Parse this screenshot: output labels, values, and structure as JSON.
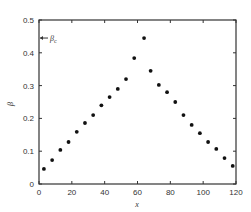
{
  "chart_data": {
    "type": "scatter",
    "title": "",
    "xlabel": "x",
    "ylabel": "β",
    "xlim": [
      0,
      120
    ],
    "ylim": [
      0,
      0.5
    ],
    "grid": false,
    "legend": null,
    "x_ticks": [
      0,
      20,
      40,
      60,
      80,
      100,
      120
    ],
    "x_tick_labels": [
      "0",
      "20",
      "40",
      "60",
      "80",
      "100",
      "120"
    ],
    "y_ticks": [
      0,
      0.1,
      0.2,
      0.3,
      0.4,
      0.5
    ],
    "y_tick_labels": [
      "0",
      "0.1",
      "0.2",
      "0.3",
      "0.4",
      "0.5"
    ],
    "annotations": [
      {
        "text": "β",
        "subscript": "c",
        "y": 0.445,
        "arrow": "points to y-axis"
      }
    ],
    "series": [
      {
        "name": "β(x)",
        "x": [
          3,
          8,
          13,
          18,
          23,
          28,
          33,
          38,
          43,
          48,
          53,
          58,
          64,
          68,
          73,
          78,
          83,
          88,
          93,
          98,
          103,
          108,
          113,
          118
        ],
        "values": [
          0.046,
          0.073,
          0.104,
          0.128,
          0.159,
          0.186,
          0.21,
          0.24,
          0.265,
          0.29,
          0.32,
          0.384,
          0.445,
          0.345,
          0.302,
          0.28,
          0.25,
          0.21,
          0.18,
          0.155,
          0.128,
          0.107,
          0.079,
          0.055
        ]
      }
    ]
  },
  "colors": {
    "marker": "#111111",
    "axis": "#333333",
    "background": "#ffffff"
  }
}
